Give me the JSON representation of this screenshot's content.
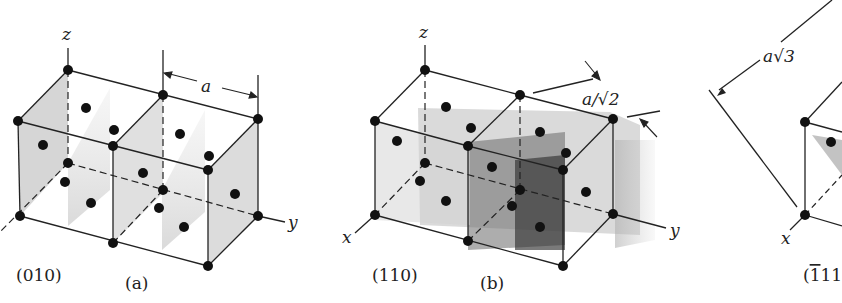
{
  "figure": {
    "panels": [
      {
        "id": "a",
        "caption": "(a)",
        "plane_label": "(010)",
        "axis_labels": {
          "z": "z",
          "y": "y",
          "x": "x"
        },
        "dimension_label": "a"
      },
      {
        "id": "b",
        "caption": "(b)",
        "plane_label": "(110)",
        "axis_labels": {
          "z": "z",
          "y": "y",
          "x": "x"
        },
        "dimension_label": "a/√2"
      },
      {
        "id": "c",
        "plane_label": "(Ġ11",
        "plane_label_bar": "1",
        "plane_label_rest": "11",
        "axis_labels": {
          "x": "x"
        },
        "dimension_label": "a√3"
      }
    ],
    "colors": {
      "line": "#222222",
      "atom": "#111111",
      "plane_light": "#bdbdbd",
      "plane_dark": "#4a4a4a"
    }
  }
}
